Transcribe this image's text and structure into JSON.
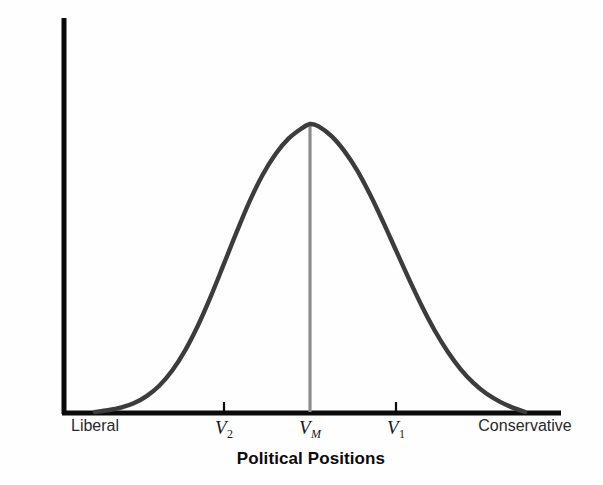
{
  "figure": {
    "background_color": "#fefefe",
    "axis_color": "#0b0b0b",
    "curve_color": "#3c3c3c",
    "median_line_color": "#8c8c8c"
  },
  "chart_data": {
    "type": "line",
    "title": "",
    "xlabel": "Political Positions",
    "ylabel": "Number of Voters",
    "grid": false,
    "legend": null,
    "xlim": [
      0,
      1
    ],
    "ylim": [
      0,
      1
    ],
    "axis_tick_labels_x": [
      "Liberal",
      "V2",
      "VM",
      "V1",
      "Conservative"
    ],
    "axis_tick_labels_y": [],
    "series": [
      {
        "name": "Voter distribution",
        "x": [
          0.0,
          0.03,
          0.06,
          0.09,
          0.12,
          0.15,
          0.18,
          0.21,
          0.24,
          0.27,
          0.3,
          0.33,
          0.36,
          0.39,
          0.42,
          0.45,
          0.48,
          0.5,
          0.52,
          0.55,
          0.58,
          0.61,
          0.64,
          0.67,
          0.7,
          0.73,
          0.76,
          0.79,
          0.82,
          0.85,
          0.88,
          0.91,
          0.94,
          0.97,
          1.0
        ],
        "y": [
          0.0,
          0.006,
          0.015,
          0.03,
          0.055,
          0.092,
          0.145,
          0.215,
          0.302,
          0.404,
          0.515,
          0.627,
          0.733,
          0.824,
          0.896,
          0.949,
          0.984,
          1.0,
          0.992,
          0.958,
          0.906,
          0.838,
          0.754,
          0.66,
          0.561,
          0.462,
          0.368,
          0.283,
          0.21,
          0.149,
          0.101,
          0.064,
          0.037,
          0.016,
          0.0
        ]
      }
    ],
    "markers": [
      {
        "name": "V2",
        "x": 0.3,
        "type": "tick",
        "label": "V",
        "subscript": "2",
        "subscript_italic": false
      },
      {
        "name": "VM",
        "x": 0.5,
        "type": "median-line",
        "label": "V",
        "subscript": "M",
        "subscript_italic": true,
        "value_y": 1.0
      },
      {
        "name": "V1",
        "x": 0.7,
        "type": "tick",
        "label": "V",
        "subscript": "1",
        "subscript_italic": false
      }
    ],
    "endpoints": [
      {
        "name": "left-endpoint",
        "x": 0.0,
        "label": "Liberal"
      },
      {
        "name": "right-endpoint",
        "x": 1.0,
        "label": "Conservative"
      }
    ]
  }
}
